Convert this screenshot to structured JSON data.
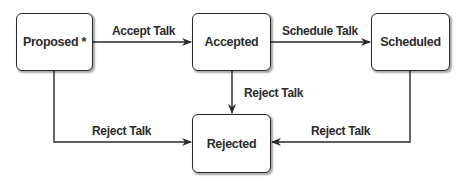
{
  "diagram": {
    "type": "state-machine",
    "states": [
      {
        "id": "proposed",
        "label": "Proposed *"
      },
      {
        "id": "accepted",
        "label": "Accepted"
      },
      {
        "id": "scheduled",
        "label": "Scheduled"
      },
      {
        "id": "rejected",
        "label": "Rejected"
      }
    ],
    "transitions": [
      {
        "from": "proposed",
        "to": "accepted",
        "label": "Accept Talk"
      },
      {
        "from": "accepted",
        "to": "scheduled",
        "label": "Schedule Talk"
      },
      {
        "from": "accepted",
        "to": "rejected",
        "label": "Reject Talk"
      },
      {
        "from": "proposed",
        "to": "rejected",
        "label": "Reject Talk"
      },
      {
        "from": "scheduled",
        "to": "rejected",
        "label": "Reject Talk"
      }
    ],
    "colors": {
      "stroke": "#2a2a2a",
      "text": "#2b2b2b",
      "background": "#ffffff"
    }
  }
}
